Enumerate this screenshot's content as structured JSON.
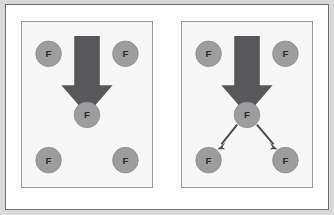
{
  "figure": {
    "title": "",
    "background_color": "#d9d9d9",
    "frame_color": "#6e6e6e",
    "panel_background": "#f7f7f7",
    "panel_border_color": "#9b9b9b",
    "node_fill_color": "#9d9d9d",
    "node_label_color": "#2b2b2b",
    "big_arrow_color": "#58585a",
    "thin_arrow_color": "#4a4a4a"
  },
  "panels": [
    {
      "id": "left",
      "caption": "",
      "big_arrow": {
        "name": "big-down-arrow",
        "direction": "down",
        "target_node": "center"
      },
      "nodes": [
        {
          "id": "top-left",
          "label": "F",
          "cx": 27,
          "cy": 32,
          "r": 13
        },
        {
          "id": "top-right",
          "label": "F",
          "cx": 105,
          "cy": 32,
          "r": 13
        },
        {
          "id": "center",
          "label": "F",
          "cx": 66,
          "cy": 94,
          "r": 13
        },
        {
          "id": "bottom-left",
          "label": "F",
          "cx": 27,
          "cy": 140,
          "r": 13
        },
        {
          "id": "bottom-right",
          "label": "F",
          "cx": 105,
          "cy": 140,
          "r": 13
        }
      ],
      "edges": []
    },
    {
      "id": "right",
      "caption": "",
      "big_arrow": {
        "name": "big-down-arrow",
        "direction": "down",
        "target_node": "center"
      },
      "nodes": [
        {
          "id": "top-left",
          "label": "F",
          "cx": 27,
          "cy": 32,
          "r": 13
        },
        {
          "id": "top-right",
          "label": "F",
          "cx": 105,
          "cy": 32,
          "r": 13
        },
        {
          "id": "center",
          "label": "F",
          "cx": 66,
          "cy": 94,
          "r": 13
        },
        {
          "id": "bottom-left",
          "label": "F",
          "cx": 27,
          "cy": 140,
          "r": 13
        },
        {
          "id": "bottom-right",
          "label": "F",
          "cx": 105,
          "cy": 140,
          "r": 13
        }
      ],
      "edges": [
        {
          "id": "center-to-bottom-left",
          "from": "center",
          "to": "bottom-left",
          "arrowhead": true
        },
        {
          "id": "center-to-bottom-right",
          "from": "center",
          "to": "bottom-right",
          "arrowhead": true
        }
      ]
    }
  ]
}
